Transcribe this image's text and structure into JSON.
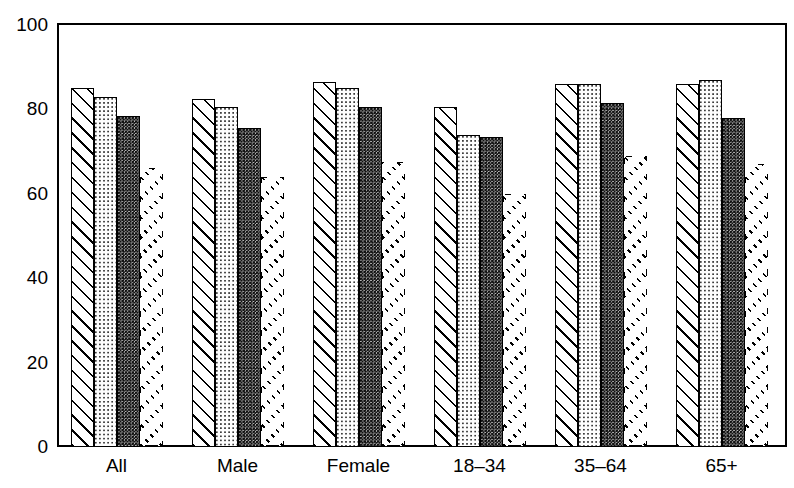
{
  "chart_data": {
    "type": "bar",
    "title": "",
    "title_remnant": "",
    "xlabel": "",
    "ylabel": "%",
    "categories": [
      "All",
      "Male",
      "Female",
      "18–34",
      "35–64",
      "65+"
    ],
    "ylim": [
      0,
      100
    ],
    "y_ticks": [
      0,
      20,
      40,
      60,
      80,
      100
    ],
    "y_tick_labels": [
      "0",
      "20",
      "40",
      "60",
      "80",
      "100"
    ],
    "grid": false,
    "legend": "none",
    "series": [
      {
        "name": "Series 1",
        "pattern": "diagonal-hatch",
        "values": [
          85,
          82.5,
          86.5,
          80.5,
          86,
          86
        ]
      },
      {
        "name": "Series 2",
        "pattern": "light-dots",
        "values": [
          83,
          80.5,
          85,
          74,
          86,
          87
        ]
      },
      {
        "name": "Series 3",
        "pattern": "dark-dots",
        "values": [
          78.5,
          75.5,
          80.5,
          73.5,
          81.5,
          78
        ]
      },
      {
        "name": "Series 4",
        "pattern": "sparse-dashes",
        "values": [
          66,
          64,
          67.5,
          60,
          69,
          67
        ]
      }
    ]
  }
}
